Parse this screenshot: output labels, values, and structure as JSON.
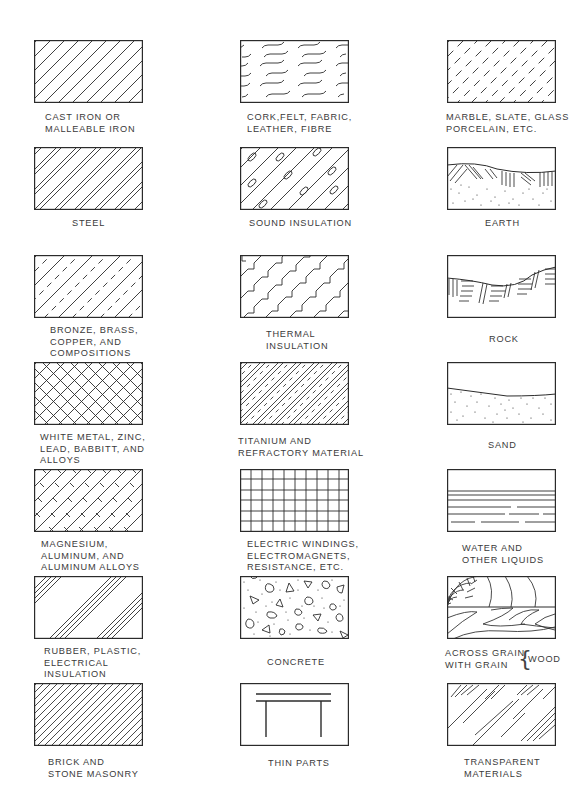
{
  "columns": [
    {
      "items": [
        {
          "id": "cast-iron",
          "label": "CAST IRON OR\nMALLEABLE IRON",
          "pattern": "uniform-diagonal-hatch"
        },
        {
          "id": "steel",
          "label": "STEEL",
          "pattern": "paired-diagonal-hatch"
        },
        {
          "id": "bronze",
          "label": "BRONZE, BRASS,\nCOPPER, AND\nCOMPOSITIONS",
          "pattern": "diagonal-solid-dash-alternating"
        },
        {
          "id": "white-metal",
          "label": "WHITE METAL, ZINC,\nLEAD, BABBITT, AND\nALLOYS",
          "pattern": "cross-hatch"
        },
        {
          "id": "magnesium",
          "label": "MAGNESIUM,\nALUMINUM, AND\nALUMINUM ALLOYS",
          "pattern": "diagonal-with-x-marks"
        },
        {
          "id": "rubber",
          "label": "RUBBER, PLASTIC,\nELECTRICAL\nINSULATION",
          "pattern": "grouped-triple-diagonals"
        },
        {
          "id": "brick",
          "label": "BRICK AND\nSTONE MASONRY",
          "pattern": "dense-diagonal-hatch"
        }
      ]
    },
    {
      "items": [
        {
          "id": "cork",
          "label": "CORK,FELT, FABRIC,\nLEATHER, FIBRE",
          "pattern": "wavy-dashes"
        },
        {
          "id": "sound-insulation",
          "label": "SOUND INSULATION",
          "pattern": "diagonal-with-ovals"
        },
        {
          "id": "thermal-insulation",
          "label": "THERMAL\nINSULATION",
          "pattern": "stepped-diagonals"
        },
        {
          "id": "titanium",
          "label": "TITANIUM AND\nREFRACTORY MATERIAL",
          "pattern": "diagonal-with-dashes-dense"
        },
        {
          "id": "electric-windings",
          "label": "ELECTRIC WINDINGS,\nELECTROMAGNETS,\nRESISTANCE, ETC.",
          "pattern": "grid"
        },
        {
          "id": "concrete",
          "label": "CONCRETE",
          "pattern": "stipple-with-aggregate"
        },
        {
          "id": "thin-parts",
          "label": "THIN PARTS",
          "pattern": "thin-section-table"
        }
      ]
    },
    {
      "items": [
        {
          "id": "marble",
          "label": "MARBLE, SLATE, GLASS\nPORCELAIN, ETC.",
          "pattern": "short-diagonal-dashes"
        },
        {
          "id": "earth",
          "label": "EARTH",
          "pattern": "earth-hatch-stipple"
        },
        {
          "id": "rock",
          "label": "ROCK",
          "pattern": "rock-strata"
        },
        {
          "id": "sand",
          "label": "SAND",
          "pattern": "sand-stipple"
        },
        {
          "id": "water",
          "label": "WATER AND\nOTHER LIQUIDS",
          "pattern": "horizontal-lines-broken"
        },
        {
          "id": "wood",
          "label": "ACROSS GRAIN\nWITH GRAIN",
          "label_group": "WOOD",
          "pattern": "wood-grain"
        },
        {
          "id": "transparent",
          "label": "TRANSPARENT\nMATERIALS",
          "pattern": "glass-streaks"
        }
      ]
    }
  ],
  "colors": {
    "line": "#2b2b2b",
    "text": "#3a3a3a",
    "background": "#ffffff"
  }
}
